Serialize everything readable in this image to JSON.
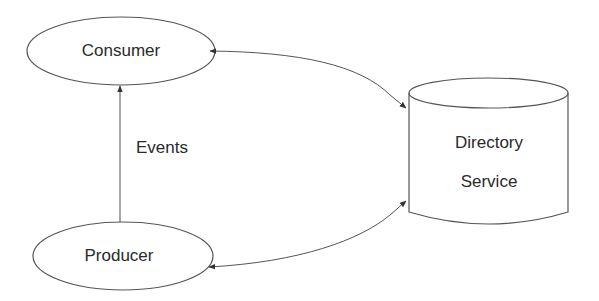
{
  "nodes": {
    "consumer": {
      "label": "Consumer",
      "shape": "ellipse"
    },
    "producer": {
      "label": "Producer",
      "shape": "ellipse"
    },
    "directory": {
      "label_line1": "Directory",
      "label_line2": "Service",
      "shape": "cylinder"
    }
  },
  "edges": {
    "events": {
      "label": "Events",
      "from": "Producer",
      "to": "Consumer"
    },
    "consumer_directory": {
      "from": "Consumer",
      "to": "Directory Service",
      "direction": "bidirectional"
    },
    "producer_directory": {
      "from": "Producer",
      "to": "Directory Service",
      "direction": "bidirectional"
    }
  },
  "colors": {
    "stroke": "#555555",
    "text": "#2a2a2a",
    "background": "#ffffff"
  }
}
